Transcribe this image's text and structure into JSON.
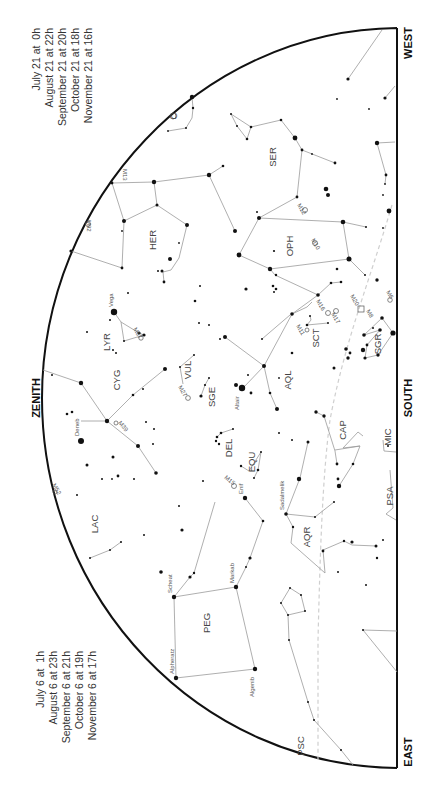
{
  "chart_title": "Evening sky star chart (rotated)",
  "cardinals": {
    "zenith": "ZENITH",
    "south": "SOUTH",
    "west": "WEST",
    "east": "EAST"
  },
  "times_upper": [
    "July 21 at  0h",
    "August 21 at 22h",
    "September 21 at 20h",
    "October 21 at 18h",
    "November 21 at 16h"
  ],
  "times_lower": [
    "July 6 at  1h",
    "August 6 at 23h",
    "September 6 at 21h",
    "October 6 at 19h",
    "November 6 at 17h"
  ],
  "constellations": {
    "ser": "SER",
    "her": "HER",
    "oph": "OPH",
    "lyr": "LYR",
    "cyg": "CYG",
    "vul": "VUL",
    "sge": "SGE",
    "aql": "AQL",
    "sct": "SCT",
    "sgr": "SGR",
    "del": "DEL",
    "equ": "EQU",
    "cap": "CAP",
    "mic": "MIC",
    "lac": "LAC",
    "aqr": "AQR",
    "psa": "PSA",
    "peg": "PEG",
    "psc": "PSC",
    "crb": "C"
  },
  "stars": {
    "vega": "Vega",
    "deneb": "Deneb",
    "altair": "Altair",
    "enif": "Enif",
    "sadalmelik": "Sadalmelik",
    "markab": "Markab",
    "scheat": "Scheat",
    "alpheratz": "Alpheratz",
    "algenib": "Algenib"
  },
  "deep_sky": {
    "m13": "M13",
    "m92": "M92",
    "m12": "M12",
    "m10": "M10",
    "m57": "M57",
    "m27": "M27",
    "m39": "M39",
    "m11": "M11",
    "m16": "M16",
    "m17": "M17",
    "m20": "M20",
    "m8": "M8",
    "m6": "M6",
    "m15": "M15",
    "m52": "M52"
  }
}
